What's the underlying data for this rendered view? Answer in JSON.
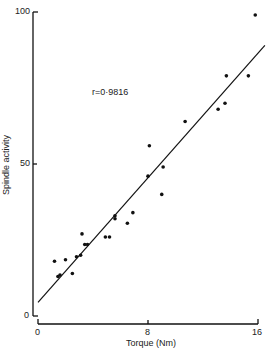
{
  "chart_data": {
    "type": "scatter",
    "title": "",
    "xlabel": "Torque (Nm)",
    "ylabel": "Spindle activity",
    "xlim": [
      0,
      16
    ],
    "ylim": [
      0,
      100
    ],
    "xticks": [
      0,
      8,
      16
    ],
    "yticks": [
      0,
      50,
      100
    ],
    "grid": false,
    "legend": null,
    "annotations": [
      "r=0·9816"
    ],
    "series": [
      {
        "name": "observations",
        "marker": "dot",
        "points": [
          {
            "x": 1.2,
            "y": 18
          },
          {
            "x": 1.45,
            "y": 13
          },
          {
            "x": 1.6,
            "y": 13.5
          },
          {
            "x": 2.0,
            "y": 18.5
          },
          {
            "x": 2.5,
            "y": 14
          },
          {
            "x": 2.8,
            "y": 19.5
          },
          {
            "x": 3.1,
            "y": 20
          },
          {
            "x": 3.2,
            "y": 27
          },
          {
            "x": 3.4,
            "y": 23.5
          },
          {
            "x": 3.6,
            "y": 23.5
          },
          {
            "x": 4.9,
            "y": 26
          },
          {
            "x": 5.2,
            "y": 26
          },
          {
            "x": 5.6,
            "y": 32
          },
          {
            "x": 5.6,
            "y": 33
          },
          {
            "x": 6.5,
            "y": 30.5
          },
          {
            "x": 6.9,
            "y": 34
          },
          {
            "x": 8.0,
            "y": 46
          },
          {
            "x": 8.1,
            "y": 56
          },
          {
            "x": 9.0,
            "y": 40
          },
          {
            "x": 9.1,
            "y": 49
          },
          {
            "x": 10.7,
            "y": 64
          },
          {
            "x": 13.1,
            "y": 68
          },
          {
            "x": 13.6,
            "y": 70
          },
          {
            "x": 13.7,
            "y": 79
          },
          {
            "x": 15.3,
            "y": 79
          },
          {
            "x": 15.8,
            "y": 99
          }
        ]
      },
      {
        "name": "regression line",
        "type": "line",
        "points": [
          {
            "x": 0,
            "y": 4.5
          },
          {
            "x": 16.5,
            "y": 89
          }
        ]
      }
    ]
  },
  "labels": {
    "x_axis": "Torque (Nm)",
    "y_axis": "Spindle activity",
    "correlation": "r=0·9816",
    "x_ticks": [
      "0",
      "8",
      "16"
    ],
    "y_ticks": [
      "0",
      "50",
      "100"
    ]
  }
}
